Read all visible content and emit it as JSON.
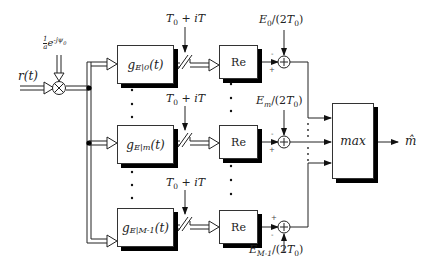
{
  "diagram": {
    "title": "",
    "input": {
      "label": "r(t)"
    },
    "phase_correction": {
      "label_frac": "1",
      "label_den": "a",
      "label_exp_base": "e",
      "label_exp": "-jψ",
      "label_exp_sub": "0"
    },
    "mixer": {
      "symbol": "⊗"
    },
    "branches": [
      {
        "filter_label": "g",
        "filter_sub": "E|0",
        "filter_arg": "(t)",
        "sampler_label": "T",
        "sampler_sub": "0",
        "sampler_rest": " + iT",
        "re_label": "Re",
        "bias_label_pre": "E",
        "bias_sub": "0",
        "bias_label_post": "/(2T",
        "bias_post_sub": "0",
        "bias_close": ")",
        "sign_top": "-",
        "sign_left": "+"
      },
      {
        "filter_label": "g",
        "filter_sub": "E|m",
        "filter_arg": "(t)",
        "sampler_label": "T",
        "sampler_sub": "0",
        "sampler_rest": " + iT",
        "re_label": "Re",
        "bias_label_pre": "E",
        "bias_sub": "m",
        "bias_label_post": "/(2T",
        "bias_post_sub": "0",
        "bias_close": ")",
        "sign_top": "-",
        "sign_left": "+"
      },
      {
        "filter_label": "g",
        "filter_sub": "E|M-1",
        "filter_arg": "(t)",
        "sampler_label": "T",
        "sampler_sub": "0",
        "sampler_rest": " + iT",
        "re_label": "Re",
        "bias_label_pre": "E",
        "bias_sub": "M-1",
        "bias_label_post": "/(2T",
        "bias_post_sub": "0",
        "bias_close": ")",
        "sign_top": "+",
        "sign_left": "-"
      }
    ],
    "decision": {
      "label": "max"
    },
    "output": {
      "label": "m̂"
    },
    "ellipsis": "⋮",
    "colors": {
      "line": "#222222",
      "shadow": "#000000",
      "background": "#ffffff"
    }
  }
}
